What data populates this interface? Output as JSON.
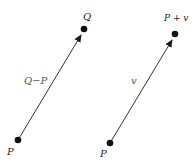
{
  "diagram": {
    "stroke_color": "#1a1a1a",
    "left": {
      "start_label": "P",
      "end_label": "Q",
      "vector_label": "Q−P"
    },
    "right": {
      "start_label": "P",
      "end_label": "P + v",
      "vector_label": "v"
    }
  }
}
